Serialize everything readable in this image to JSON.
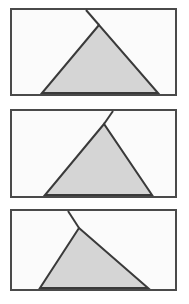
{
  "figure": {
    "type": "geometry-diagram",
    "panel_count": 3,
    "canvas": {
      "width": 189,
      "height": 304,
      "background": "#ffffff"
    },
    "style": {
      "frame_stroke": "#4a4a4a",
      "frame_stroke_width": 2,
      "frame_fill": "#fbfbfb",
      "triangle_fill": "#d5d5d5",
      "triangle_stroke": "#3a3a3a",
      "triangle_stroke_width": 2,
      "overshoot_stroke": "#3a3a3a",
      "overshoot_stroke_width": 2
    },
    "panels": [
      {
        "name": "panel-1",
        "label": "top",
        "frame": {
          "x": 11,
          "y": 9,
          "width": 165,
          "height": 86
        },
        "triangle": {
          "apex": {
            "x": 99,
            "y": 25
          },
          "base_left": {
            "x": 42,
            "y": 93
          },
          "base_right": {
            "x": 158,
            "y": 93
          }
        },
        "overshoot": {
          "side": "left",
          "from": {
            "x": 99,
            "y": 25
          },
          "to": {
            "x": 86,
            "y": 10
          }
        }
      },
      {
        "name": "panel-2",
        "label": "middle",
        "frame": {
          "x": 11,
          "y": 110,
          "width": 165,
          "height": 87
        },
        "triangle": {
          "apex": {
            "x": 104,
            "y": 124
          },
          "base_left": {
            "x": 45,
            "y": 195
          },
          "base_right": {
            "x": 152,
            "y": 195
          }
        },
        "overshoot": {
          "side": "right",
          "from": {
            "x": 104,
            "y": 124
          },
          "to": {
            "x": 113,
            "y": 111
          }
        }
      },
      {
        "name": "panel-3",
        "label": "bottom",
        "frame": {
          "x": 11,
          "y": 210,
          "width": 165,
          "height": 80
        },
        "triangle": {
          "apex": {
            "x": 79,
            "y": 228
          },
          "base_left": {
            "x": 40,
            "y": 288
          },
          "base_right": {
            "x": 148,
            "y": 288
          }
        },
        "overshoot": {
          "side": "left",
          "from": {
            "x": 79,
            "y": 228
          },
          "to": {
            "x": 68,
            "y": 211
          }
        }
      }
    ]
  }
}
